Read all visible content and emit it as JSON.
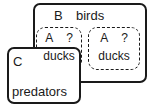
{
  "diagram": {
    "type": "nested-box-set-diagram",
    "boxes": [
      {
        "id": "B",
        "label": "B",
        "name": "birds",
        "style": "solid"
      },
      {
        "id": "C",
        "label": "C",
        "name": "predators",
        "style": "solid"
      }
    ],
    "dashed_boxes": [
      {
        "id": "A-left",
        "label": "A",
        "question": "?",
        "name": "ducks",
        "style": "dashed"
      },
      {
        "id": "A-right",
        "label": "A",
        "question": "?",
        "name": "ducks",
        "style": "dashed"
      }
    ],
    "colors": {
      "stroke": "#1a1a1a",
      "background": "#ffffff"
    }
  }
}
